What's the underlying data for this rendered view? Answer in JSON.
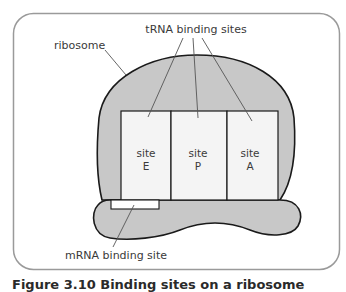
{
  "diagram": {
    "labels": {
      "ribosome": "ribosome",
      "trna_binding_sites": "tRNA binding sites",
      "mrna_binding_site": "mRNA binding site"
    },
    "sites": [
      {
        "word": "site",
        "letter": "E"
      },
      {
        "word": "site",
        "letter": "P"
      },
      {
        "word": "site",
        "letter": "A"
      }
    ],
    "colors": {
      "frame_border": "#9a9a9a",
      "ribosome_fill": "#c8c8c8",
      "site_fill": "#f4f4f4",
      "outline": "#1a1a1a",
      "leader_line": "#555555"
    }
  },
  "caption": "Figure 3.10 Binding sites on a ribosome"
}
